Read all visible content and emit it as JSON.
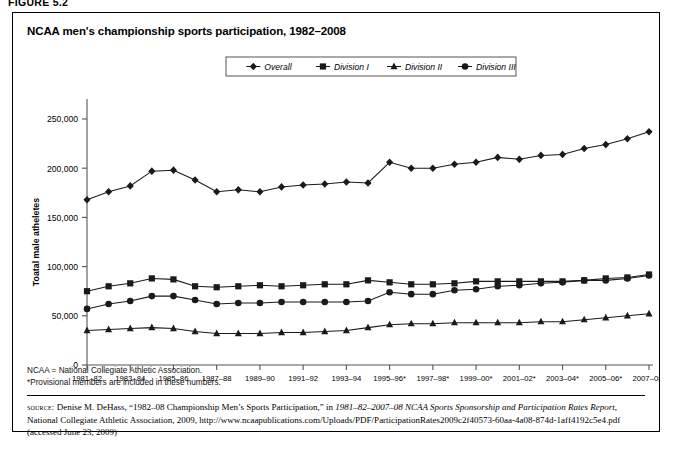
{
  "figure_label": "FIGURE 5.2",
  "title": "NCAA men's championship sports participation, 1982–2008",
  "notes": {
    "abbrev": "NCAA = National Collegiate Athletic Association.",
    "footnote": "*Provisional members are included in these numbers."
  },
  "source": {
    "label": "source:",
    "text_1": " Denise M. DeHass, “1982–08 Championship Men’s Sports Participation,” in ",
    "italic_1": "1981–82–2007–08 NCAA Sports Sponsorship and Participation Rates Report",
    "text_2": ", National Collegiate Athletic Association, 2009, http://www.ncaapublications.com/Uploads/PDF/ParticipationRates2009c2f40573-60aa-4a08-874d-1aff4192c5e4.pdf (accessed June 23, 2009)"
  },
  "colors": {
    "line": "#1a1a1a",
    "axis": "#555555",
    "text": "#000000",
    "frame": "#000000"
  },
  "chart_data": {
    "type": "line",
    "title": "NCAA men's championship sports participation, 1982–2008",
    "xlabel": "",
    "ylabel": "Toatal male atheletes",
    "ylim": [
      0,
      250000
    ],
    "yticks": [
      0,
      50000,
      100000,
      150000,
      200000,
      250000
    ],
    "ytick_labels": [
      "0",
      "50,000",
      "100,000",
      "150,000",
      "200,000",
      "250,000"
    ],
    "grid": false,
    "legend_position": "top-center",
    "categories": [
      "1981–82",
      "1982–83",
      "1983–84",
      "1984–85",
      "1985–86",
      "1986–87",
      "1987–88",
      "1988–89",
      "1989–90",
      "1990–91",
      "1991–92",
      "1992–93",
      "1993–94",
      "1994–95",
      "1995–96*",
      "1996–97*",
      "1997–98*",
      "1998–99*",
      "1999–00*",
      "2000–01*",
      "2001–02*",
      "2002–03*",
      "2003–04*",
      "2004–05*",
      "2005–06*",
      "2006–07*",
      "2007–08*"
    ],
    "tick_labels_shown": [
      "1981–82",
      "1983–84",
      "1985–86",
      "1987–88",
      "1989–90",
      "1991–92",
      "1993–94",
      "1995–96*",
      "1997–98*",
      "1999–00*",
      "2001–02*",
      "2003–04*",
      "2005–06*",
      "2007–08*"
    ],
    "series": [
      {
        "name": "Overall",
        "marker": "diamond",
        "values": [
          168000,
          176000,
          182000,
          197000,
          198000,
          188000,
          176000,
          178000,
          176000,
          181000,
          183000,
          184000,
          186000,
          185000,
          206000,
          200000,
          200000,
          204000,
          206000,
          211000,
          209000,
          213000,
          214000,
          220000,
          224000,
          230000,
          237000
        ]
      },
      {
        "name": "Division I",
        "marker": "square",
        "values": [
          75000,
          80000,
          83000,
          88000,
          87000,
          80000,
          79000,
          80000,
          81000,
          80000,
          81000,
          82000,
          82000,
          86000,
          84000,
          82000,
          82000,
          83000,
          85000,
          85000,
          85000,
          85000,
          85000,
          86000,
          88000,
          89000,
          92000
        ]
      },
      {
        "name": "Division II",
        "marker": "triangle",
        "values": [
          35000,
          36000,
          37000,
          38000,
          37000,
          34000,
          32000,
          32000,
          32000,
          33000,
          33000,
          34000,
          35000,
          38000,
          41000,
          42000,
          42000,
          43000,
          43000,
          43000,
          43000,
          44000,
          44000,
          46000,
          48000,
          50000,
          52000
        ]
      },
      {
        "name": "Division III",
        "marker": "circle",
        "values": [
          57000,
          62000,
          65000,
          70000,
          70000,
          66000,
          62000,
          63000,
          63000,
          64000,
          64000,
          64000,
          64000,
          65000,
          74000,
          72000,
          72000,
          76000,
          77000,
          80000,
          81000,
          83000,
          84000,
          86000,
          86000,
          88000,
          91000
        ]
      }
    ]
  }
}
